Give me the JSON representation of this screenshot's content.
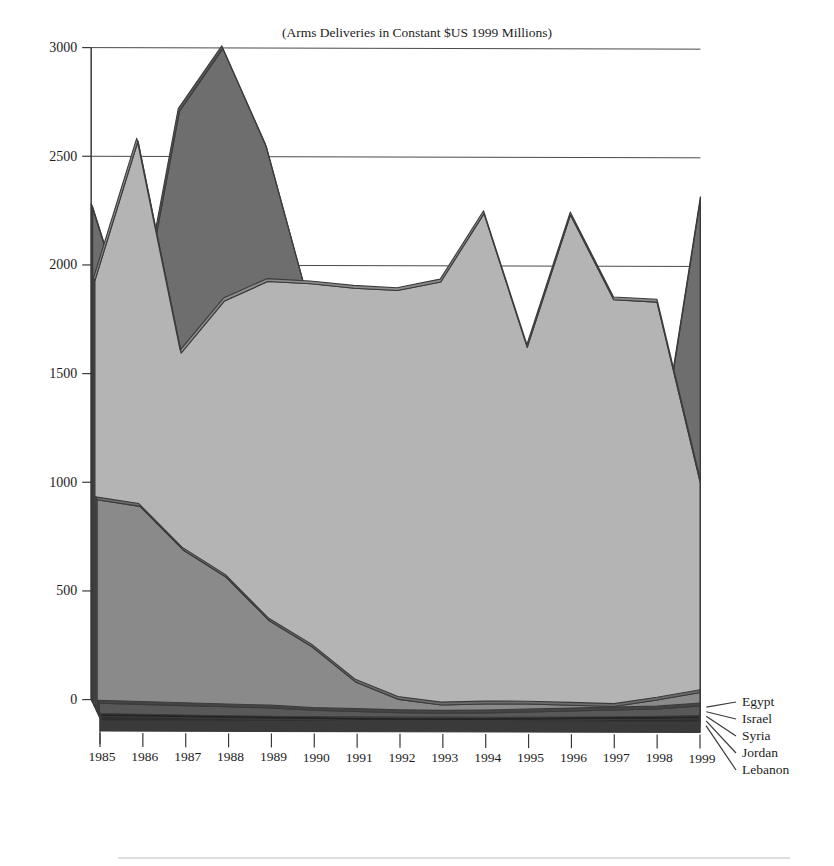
{
  "chart_data": {
    "type": "area",
    "title": "(Arms Deliveries in Constant $US 1999 Millions)",
    "xlabel": "",
    "ylabel": "",
    "ylim": [
      0,
      3000
    ],
    "ytick_step": 500,
    "grid": true,
    "legend_position": "right-floor",
    "projection": "3d-stacked-ribbons",
    "categories": [
      "1985",
      "1986",
      "1987",
      "1988",
      "1989",
      "1990",
      "1991",
      "1992",
      "1993",
      "1994",
      "1995",
      "1996",
      "1997",
      "1998",
      "1999"
    ],
    "yticks": [
      "0",
      "500",
      "1000",
      "1500",
      "2000",
      "2500",
      "3000"
    ],
    "series": [
      {
        "name": "Egypt",
        "color": "#6e6e6e",
        "values": [
          2280,
          1650,
          2720,
          3010,
          2560,
          1830,
          1800,
          1830,
          1820,
          1790,
          1520,
          1190,
          830,
          1050,
          2320
        ]
      },
      {
        "name": "Israel",
        "color": "#b4b4b4",
        "values": [
          1960,
          2605,
          1630,
          1870,
          1960,
          1950,
          1930,
          1920,
          1960,
          2275,
          1660,
          2270,
          1880,
          1870,
          1040
        ]
      },
      {
        "name": "Syria",
        "color": "#8a8a8a",
        "values": [
          975,
          945,
          745,
          620,
          420,
          300,
          140,
          60,
          35,
          40,
          40,
          35,
          30,
          60,
          95
        ]
      },
      {
        "name": "Jordan",
        "color": "#585858",
        "values": [
          60,
          55,
          50,
          45,
          40,
          30,
          25,
          20,
          18,
          20,
          25,
          30,
          35,
          40,
          55
        ]
      },
      {
        "name": "Lebanon",
        "color": "#2e2e2e",
        "values": [
          20,
          18,
          15,
          12,
          10,
          8,
          6,
          5,
          5,
          6,
          8,
          10,
          12,
          14,
          18
        ]
      }
    ]
  },
  "legend": {
    "items": [
      "Egypt",
      "Israel",
      "Syria",
      "Jordan",
      "Lebanon"
    ]
  }
}
